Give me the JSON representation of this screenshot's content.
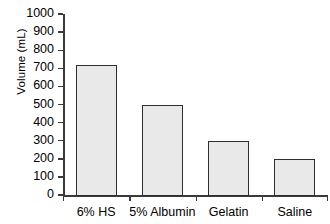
{
  "chart_data": {
    "type": "bar",
    "title": "",
    "xlabel": "",
    "ylabel": "Volume (mL)",
    "categories": [
      "6% HS",
      "5% Albumin",
      "Gelatin",
      "Saline"
    ],
    "values": [
      720,
      500,
      300,
      200
    ],
    "ylim": [
      0,
      1000
    ],
    "ytick_labels": [
      "0",
      "100",
      "200",
      "300",
      "400",
      "500",
      "600",
      "700",
      "800",
      "900",
      "1000"
    ],
    "ytick_values": [
      0,
      100,
      200,
      300,
      400,
      500,
      600,
      700,
      800,
      900,
      1000
    ],
    "grid": false,
    "legend": false,
    "legend_position": "none",
    "bar_fill_color": "#e9e9e9",
    "bar_edge_color": "#2e2e2e",
    "axis_color": "#3a3a3a",
    "background_color": "#ffffff"
  }
}
